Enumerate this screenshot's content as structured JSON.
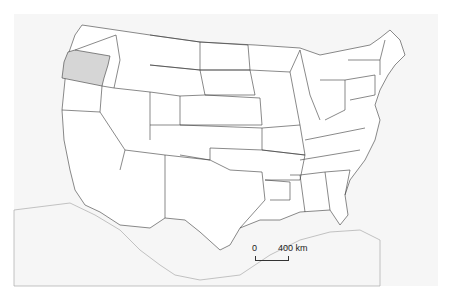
{
  "map": {
    "title": "Contiguous United States",
    "highlighted_state": "Oregon",
    "highlight_color": "#d6d6d6",
    "background_color": "#f6f6f6",
    "land_color": "#ffffff",
    "border_color": "#3a3a3a"
  },
  "scale_bar": {
    "zero_label": "0",
    "distance_label": "400 km"
  }
}
